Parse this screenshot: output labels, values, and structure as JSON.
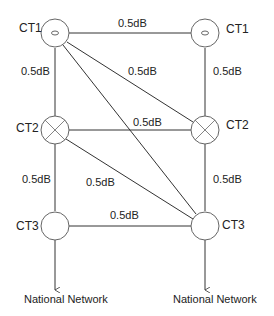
{
  "diagram": {
    "nodes": [
      {
        "id": "CT1_left",
        "label": "CT1",
        "symbol": "oval-dot"
      },
      {
        "id": "CT2_left",
        "label": "CT2",
        "symbol": "cross"
      },
      {
        "id": "CT3_left",
        "label": "CT3",
        "symbol": "empty"
      },
      {
        "id": "CT1_right",
        "label": "CT1",
        "symbol": "oval-dot"
      },
      {
        "id": "CT2_right",
        "label": "CT2",
        "symbol": "cross"
      },
      {
        "id": "CT3_right",
        "label": "CT3",
        "symbol": "empty"
      }
    ],
    "edge_labels": {
      "ct1_ct1": "0.5dB",
      "ct1l_ct2l": "0.5dB",
      "ct1r_ct2r": "0.5dB",
      "ct1l_ct2r": "0.5dB",
      "ct2_ct2": "0.5dB",
      "ct2l_ct3l": "0.5dB",
      "ct2r_ct3r": "0.5dB",
      "ct2l_ct3r": "0.5dB",
      "ct3_ct3": "0.5dB"
    },
    "outputs": {
      "left": "National Network",
      "right": "National Network"
    }
  }
}
